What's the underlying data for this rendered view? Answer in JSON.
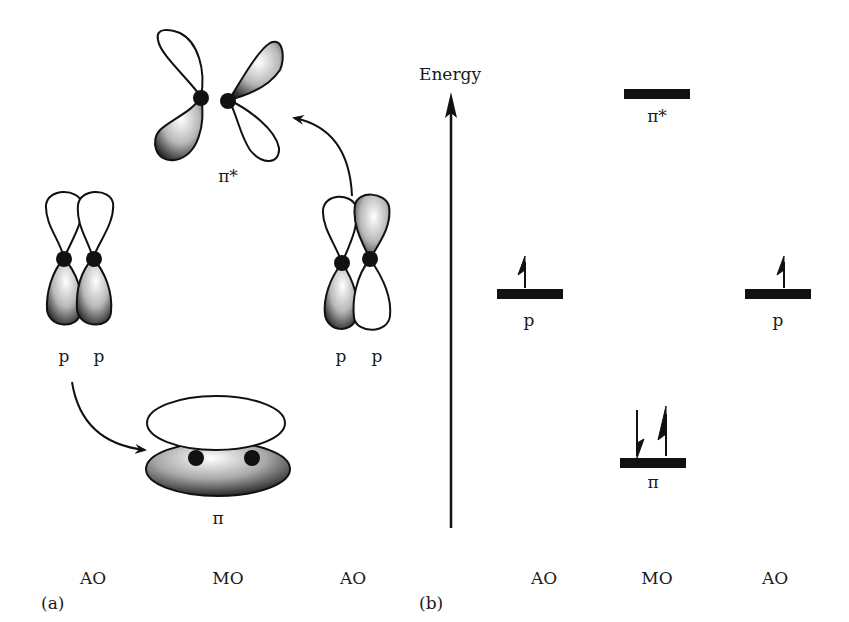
{
  "panel_a": {
    "label": "(a)",
    "pi_star_label": "π*",
    "pi_label": "π",
    "left_p_labels": [
      "p",
      "p"
    ],
    "right_p_labels": [
      "p",
      "p"
    ],
    "columns": [
      "AO",
      "MO",
      "AO"
    ]
  },
  "panel_b": {
    "label": "(b)",
    "axis_label": "Energy",
    "columns": [
      "AO",
      "MO",
      "AO"
    ],
    "levels": {
      "pi_star": {
        "label": "π*",
        "electrons": 0
      },
      "p_left": {
        "label": "p",
        "electrons": 1
      },
      "p_right": {
        "label": "p",
        "electrons": 1
      },
      "pi": {
        "label": "π",
        "electrons": 2
      }
    }
  }
}
